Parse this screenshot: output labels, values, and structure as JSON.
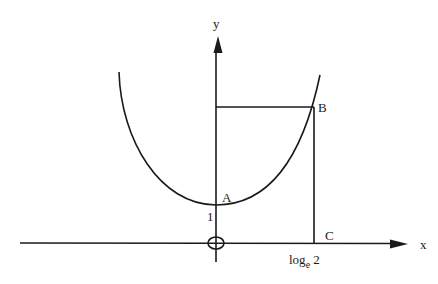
{
  "diagram": {
    "type": "function-graph",
    "axes": {
      "x_label": "x",
      "y_label": "y",
      "origin_label": "O"
    },
    "points": {
      "A": "A",
      "B": "B",
      "C": "C"
    },
    "ticks": {
      "y_intercept": "1",
      "x_log_base": "log",
      "x_log_sub": "e",
      "x_log_arg": "2"
    },
    "colors": {
      "stroke": "#1a1a1a",
      "background": "#ffffff"
    }
  }
}
